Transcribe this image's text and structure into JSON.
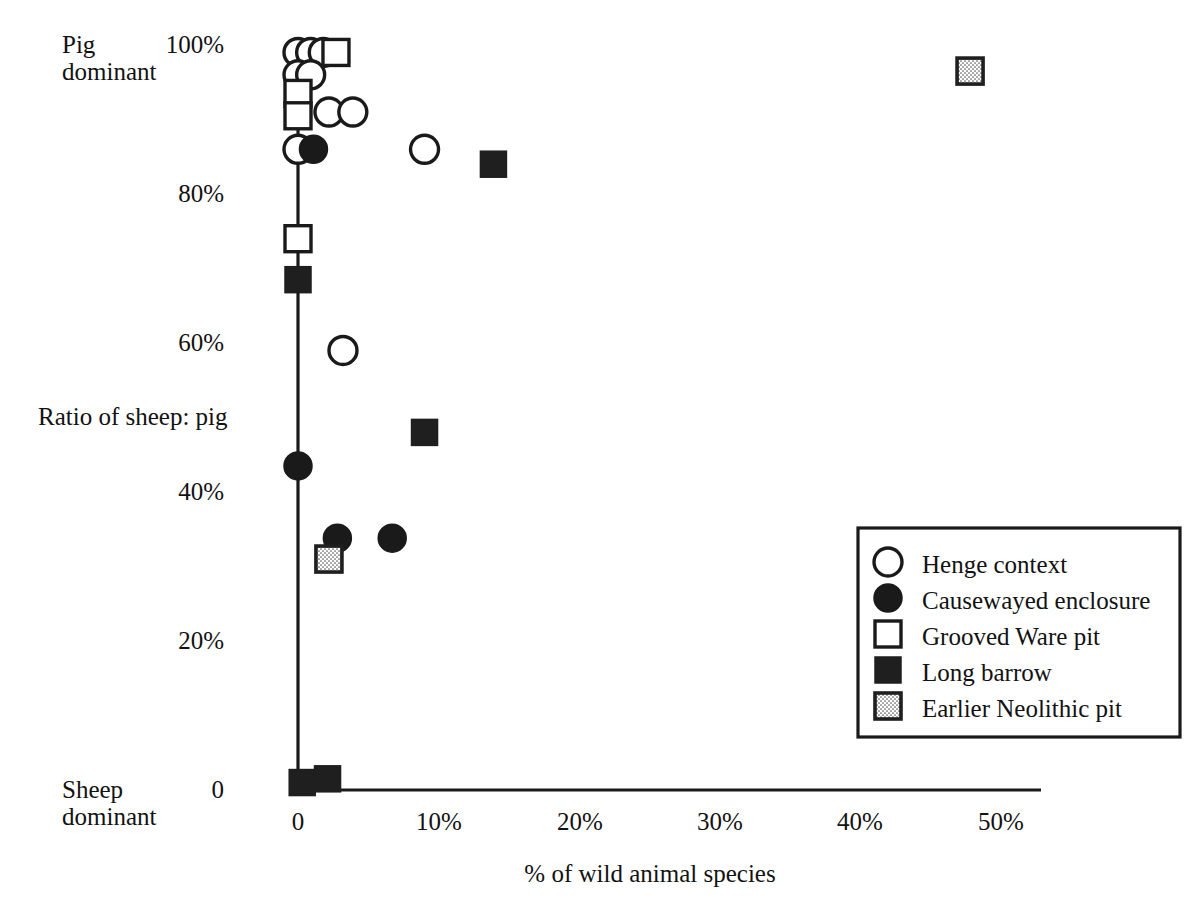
{
  "axes": {
    "y_label": "Ratio of sheep: pig",
    "y_top_note_line1": "Pig",
    "y_top_note_line2": "dominant",
    "y_bottom_note_line1": "Sheep",
    "y_bottom_note_line2": "dominant",
    "x_label": "% of wild animal species",
    "y_ticks": [
      "100%",
      "80%",
      "60%",
      "40%",
      "20%",
      "0"
    ],
    "x_ticks": [
      "0",
      "10%",
      "20%",
      "30%",
      "40%",
      "50%"
    ],
    "axis_color": "#1a1a1a"
  },
  "legend": {
    "items": [
      {
        "label": "Henge context",
        "marker": "open-circle"
      },
      {
        "label": "Causewayed enclosure",
        "marker": "filled-circle"
      },
      {
        "label": "Grooved Ware pit",
        "marker": "open-square"
      },
      {
        "label": "Long barrow",
        "marker": "filled-square"
      },
      {
        "label": "Earlier Neolithic pit",
        "marker": "stippled-square"
      }
    ],
    "border_color": "#1a1a1a"
  },
  "chart_data": {
    "type": "scatter",
    "title": "",
    "xlabel": "% of wild animal species",
    "ylabel": "Ratio of sheep: pig",
    "xlim": [
      0,
      50
    ],
    "ylim": [
      0,
      100
    ],
    "grid": false,
    "legend_position": "bottom-right",
    "xticks": [
      0,
      10,
      20,
      30,
      40,
      50
    ],
    "yticks": [
      0,
      20,
      40,
      60,
      80,
      100
    ],
    "series": [
      {
        "name": "Henge context",
        "marker": "open-circle",
        "points": [
          {
            "x": 0.0,
            "y": 99.0
          },
          {
            "x": 0.9,
            "y": 99.0
          },
          {
            "x": 1.8,
            "y": 99.0
          },
          {
            "x": 0.0,
            "y": 96.0
          },
          {
            "x": 0.9,
            "y": 96.0
          },
          {
            "x": 0.0,
            "y": 86.0
          },
          {
            "x": 2.2,
            "y": 91.0
          },
          {
            "x": 3.9,
            "y": 91.0
          },
          {
            "x": 3.2,
            "y": 59.0
          },
          {
            "x": 9.0,
            "y": 86.0
          }
        ]
      },
      {
        "name": "Causewayed enclosure",
        "marker": "filled-circle",
        "points": [
          {
            "x": 1.1,
            "y": 86.0
          },
          {
            "x": 0.0,
            "y": 43.5
          },
          {
            "x": 2.8,
            "y": 33.8
          },
          {
            "x": 6.7,
            "y": 33.8
          }
        ]
      },
      {
        "name": "Grooved Ware pit",
        "marker": "open-square",
        "points": [
          {
            "x": 2.7,
            "y": 99.0
          },
          {
            "x": 0.0,
            "y": 93.5
          },
          {
            "x": 0.0,
            "y": 90.5
          },
          {
            "x": 0.0,
            "y": 74.0
          }
        ]
      },
      {
        "name": "Long barrow",
        "marker": "filled-square",
        "points": [
          {
            "x": 13.9,
            "y": 84.0
          },
          {
            "x": 0.0,
            "y": 68.5
          },
          {
            "x": 9.0,
            "y": 48.0
          },
          {
            "x": 0.3,
            "y": 1.0
          },
          {
            "x": 2.1,
            "y": 1.5
          }
        ]
      },
      {
        "name": "Earlier Neolithic pit",
        "marker": "stippled-square",
        "points": [
          {
            "x": 47.8,
            "y": 96.5
          },
          {
            "x": 2.2,
            "y": 31.0
          }
        ]
      }
    ]
  }
}
